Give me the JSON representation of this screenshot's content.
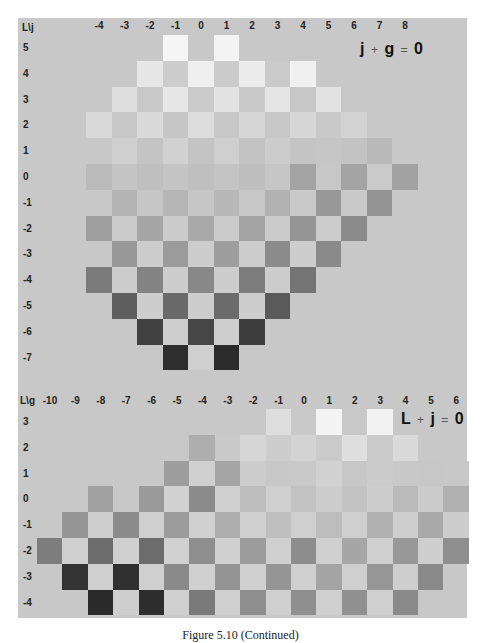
{
  "chart_data": [
    {
      "type": "heatmap",
      "title": "j + g = 0",
      "corner_label": "L\\j",
      "xlabel": "j",
      "ylabel": "L",
      "x": [
        -4,
        -3,
        -2,
        -1,
        0,
        1,
        2,
        3,
        4,
        5,
        6,
        7,
        8
      ],
      "y": [
        5,
        4,
        3,
        2,
        1,
        0,
        -1,
        -2,
        -3,
        -4,
        -5,
        -6,
        -7
      ],
      "encoding": "grayscale hex per cell; checkerboard diamond, null = no cell",
      "rows": [
        {
          "L": 5,
          "start_j": -1,
          "cells": [
            "#f5f5f5",
            null,
            "#f4f4f4"
          ]
        },
        {
          "L": 4,
          "start_j": -2,
          "cells": [
            "#e7e7e7",
            "#cdcdcd",
            "#efefef",
            "#cbcbcb",
            "#ececec",
            "#cacaca",
            "#f0f0f0"
          ]
        },
        {
          "L": 3,
          "start_j": -3,
          "cells": [
            "#dfdfdf",
            "#c9c9c9",
            "#e6e6e6",
            "#cacaca",
            "#e2e2e2",
            "#c9c9c9",
            "#e4e4e4",
            "#c8c8c8",
            "#e2e2e2"
          ]
        },
        {
          "L": 2,
          "start_j": -4,
          "cells": [
            "#d9d9d9",
            "#c7c7c7",
            "#dadada",
            "#c6c6c6",
            "#dcdcdc",
            "#c8c8c8",
            "#d6d6d6",
            "#c7c7c7",
            "#d6d6d6",
            "#c9c9c9",
            "#d3d3d3"
          ]
        },
        {
          "L": 1,
          "start_j": -3,
          "cells": [
            "#cfcfcf",
            "#c4c4c4",
            "#d1d1d1",
            "#c4c4c4",
            "#cfcfcf",
            "#c3c3c3",
            "#cccccc",
            "#c4c4c4",
            "#c6c6c6",
            "#c3c3c3",
            "#b9b9b9"
          ]
        },
        {
          "L": 0,
          "start_j": -4,
          "cells": [
            "#bababa",
            "#c5c5c5",
            "#bfbfbf",
            "#c5c5c5",
            "#bfbfbf",
            "#c4c4c4",
            "#bebebe",
            "#c6c6c6",
            "#a3a3a3",
            "#c7c7c7",
            "#a4a4a4",
            "#cacaca",
            "#a2a2a2"
          ]
        },
        {
          "L": -1,
          "start_j": -3,
          "cells": [
            "#b4b4b4",
            "#c6c6c6",
            "#b6b6b6",
            "#c6c6c6",
            "#b8b8b8",
            "#c7c7c7",
            "#b2b2b2",
            "#c9c9c9",
            "#999999",
            "#c9c9c9",
            "#949494"
          ]
        },
        {
          "L": -2,
          "start_j": -4,
          "cells": [
            "#9f9f9f",
            "#cbcbcb",
            "#a6a6a6",
            "#cbcbcb",
            "#a8a8a8",
            "#cbcbcb",
            "#a3a3a3",
            "#cbcbcb",
            "#959595",
            "#cccccc",
            "#8b8b8b"
          ]
        },
        {
          "L": -3,
          "start_j": -3,
          "cells": [
            "#999999",
            "#cdcdcd",
            "#9b9b9b",
            "#cdcdcd",
            "#9e9e9e",
            "#cdcdcd",
            "#8c8c8c",
            "#cdcdcd",
            "#8a8a8a"
          ]
        },
        {
          "L": -4,
          "start_j": -4,
          "cells": [
            "#7b7b7b",
            "#cdcdcd",
            "#848484",
            "#cdcdcd",
            "#888888",
            "#cdcdcd",
            "#7c7c7c",
            "#cdcdcd",
            "#747474"
          ]
        },
        {
          "L": -5,
          "start_j": -3,
          "cells": [
            "#5e5e5e",
            "#cdcdcd",
            "#6a6a6a",
            "#cdcdcd",
            "#6b6b6b",
            "#cdcdcd",
            "#5a5a5a"
          ]
        },
        {
          "L": -6,
          "start_j": -2,
          "cells": [
            "#414141",
            "#cecece",
            "#474747",
            "#cecece",
            "#3e3e3e"
          ]
        },
        {
          "L": -7,
          "start_j": -1,
          "cells": [
            "#2e2e2e",
            "#cfcfcf",
            "#2b2b2b"
          ]
        }
      ]
    },
    {
      "type": "heatmap",
      "title": "L + j = 0",
      "corner_label": "L\\g",
      "xlabel": "g",
      "ylabel": "L",
      "x": [
        -10,
        -9,
        -8,
        -7,
        -6,
        -5,
        -4,
        -3,
        -2,
        -1,
        0,
        1,
        2,
        3,
        4,
        5,
        6
      ],
      "y": [
        3,
        2,
        1,
        0,
        -1,
        -2,
        -3,
        -4
      ],
      "encoding": "grayscale hex per cell; checkerboard, null = no cell",
      "rows": [
        {
          "L": 3,
          "start_g": -1,
          "cells": [
            "#dedede",
            "#c9c9c9",
            "#f4f4f4",
            "#c9c9c9",
            "#f2f2f2"
          ]
        },
        {
          "L": 2,
          "start_g": -4,
          "cells": [
            "#aeaeae",
            "#c9c9c9",
            "#d6d6d6",
            "#cdcdcd",
            "#d3d3d3",
            "#cacaca",
            "#dfdfdf",
            "#cbcbcb",
            "#dadada"
          ]
        },
        {
          "L": 1,
          "start_g": -5,
          "cells": [
            "#9e9e9e",
            "#d0d0d0",
            "#a5a5a5",
            "#cdcdcd",
            "#c8c8c8",
            "#c9c9c9",
            "#d2d2d2",
            "#c7c7c7",
            "#cbcbcb",
            "#c8c8c8",
            "#c7c7c7",
            "#c8c8c8"
          ]
        },
        {
          "L": 0,
          "start_g": -8,
          "cells": [
            "#a0a0a0",
            "#c8c8c8",
            "#9a9a9a",
            "#d2d2d2",
            "#8c8c8c",
            "#d0d0d0",
            "#bdbdbd",
            "#cfcfcf",
            "#c2c2c2",
            "#cdcdcd",
            "#c2c2c2",
            "#cdcdcd",
            "#bababa",
            "#cbcbcb",
            "#b0b0b0"
          ]
        },
        {
          "L": -1,
          "start_g": -9,
          "cells": [
            "#959595",
            "#cecece",
            "#8c8c8c",
            "#cfcfcf",
            "#9c9c9c",
            "#d0d0d0",
            "#adadad",
            "#d0d0d0",
            "#bfbfbf",
            "#cfcfcf",
            "#bdbdbd",
            "#cfcfcf",
            "#b1b1b1",
            "#cecece",
            "#a9a9a9",
            "#cdcdcd"
          ]
        },
        {
          "L": -2,
          "start_g": -10,
          "cells": [
            "#7d7d7d",
            "#d0d0d0",
            "#6c6c6c",
            "#d0d0d0",
            "#6c6c6c",
            "#d1d1d1",
            "#8e8e8e",
            "#d0d0d0",
            "#9c9c9c",
            "#d0d0d0",
            "#8d8d8d",
            "#cfcfcf",
            "#a6a6a6",
            "#cfcfcf",
            "#989898",
            "#cecece",
            "#8f8f8f"
          ]
        },
        {
          "L": -3,
          "start_g": -9,
          "cells": [
            "#333333",
            "#cfcfcf",
            "#303030",
            "#cfcfcf",
            "#8a8a8a",
            "#d0d0d0",
            "#939393",
            "#cfcfcf",
            "#959595",
            "#cfcfcf",
            "#a4a4a4",
            "#cfcfcf",
            "#969696",
            "#cecece",
            "#898989"
          ]
        },
        {
          "L": -4,
          "start_g": -8,
          "cells": [
            "#2a2a2a",
            "#cecece",
            "#2d2d2d",
            "#cfcfcf",
            "#7a7a7a",
            "#cfcfcf",
            "#8e8e8e",
            "#cfcfcf",
            "#8f8f8f",
            "#cfcfcf",
            "#909090",
            "#cfcfcf",
            "#8a8a8a"
          ]
        }
      ]
    }
  ],
  "top": {
    "corner": "L\\j",
    "equation": {
      "lhs1": "j",
      "op1": "+",
      "lhs2": "g",
      "op2": "=",
      "rhs": "0"
    },
    "col_labels": [
      "-4",
      "-3",
      "-2",
      "-1",
      "0",
      "1",
      "2",
      "3",
      "4",
      "5",
      "6",
      "7",
      "8"
    ],
    "row_labels": [
      "5",
      "4",
      "3",
      "2",
      "1",
      "0",
      "-1",
      "-2",
      "-3",
      "-4",
      "-5",
      "-6",
      "-7"
    ]
  },
  "bottom": {
    "corner": "L\\g",
    "equation": {
      "lhs1": "L",
      "op1": "+",
      "lhs2": "j",
      "op2": "=",
      "rhs": "0"
    },
    "col_labels": [
      "-10",
      "-9",
      "-8",
      "-7",
      "-6",
      "-5",
      "-4",
      "-3",
      "-2",
      "-1",
      "0",
      "1",
      "2",
      "3",
      "4",
      "5",
      "6"
    ],
    "row_labels": [
      "3",
      "2",
      "1",
      "0",
      "-1",
      "-2",
      "-3",
      "-4"
    ]
  },
  "caption": "Figure 5.10  (Continued)",
  "colors": {
    "background": "#c8c8c8",
    "page": "#ffffff",
    "text": "#222222"
  }
}
